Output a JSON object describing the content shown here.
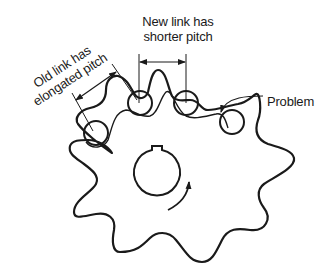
{
  "diagram": {
    "labels": {
      "new_link_line1": "New link has",
      "new_link_line2": "shorter pitch",
      "old_link_line1": "Old link has",
      "old_link_line2": "elongated pitch",
      "problem": "Problem"
    },
    "elements": {
      "sprocket": {
        "teeth": 9,
        "hub": "circular bore with keyway",
        "rotation": "counterclockwise arrow"
      },
      "chain_rollers": [
        "old-link-roller",
        "new-link-roller-1",
        "new-link-roller-2",
        "problem-roller"
      ],
      "dimension_arrows": [
        "elongated-pitch",
        "shorter-pitch"
      ],
      "leader": "problem-pointer-arrow"
    },
    "colors": {
      "stroke": "#1a1a1a",
      "background": "#ffffff"
    }
  }
}
